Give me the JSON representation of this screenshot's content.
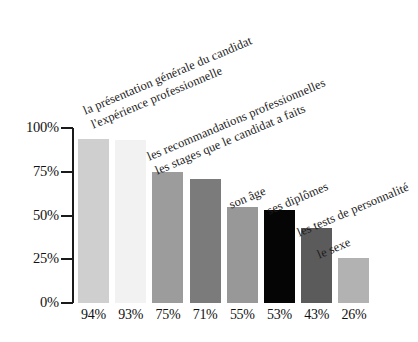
{
  "chart_data": {
    "type": "bar",
    "title": "",
    "subtitle": "",
    "xlabel": "",
    "ylabel": "",
    "ylim": [
      0,
      100
    ],
    "grid": false,
    "legend": "none",
    "orientation": "vertical",
    "categories": [
      "la présentation générale du candidat",
      "l'expérience professionnelle",
      "les recommandations professionnelles",
      "les stages que le candidat a faits",
      "son âge",
      "ses diplômes",
      "les tests de personnalité",
      "le sexe"
    ],
    "values": [
      94,
      93,
      75,
      71,
      55,
      53,
      43,
      26
    ],
    "value_labels": [
      "94%",
      "93%",
      "75%",
      "71%",
      "55%",
      "53%",
      "43%",
      "26%"
    ],
    "bar_colors": [
      "#cfcfcf",
      "#f2f2f2",
      "#9c9c9c",
      "#7b7b7b",
      "#989898",
      "#050505",
      "#5b5b5b",
      "#b2b2b2"
    ],
    "y_ticks": [
      100,
      75,
      50,
      25,
      0
    ],
    "y_tick_labels": [
      "100%",
      "75%",
      "50%",
      "25%",
      "0%"
    ],
    "axis_color": "#1a1a1a"
  }
}
